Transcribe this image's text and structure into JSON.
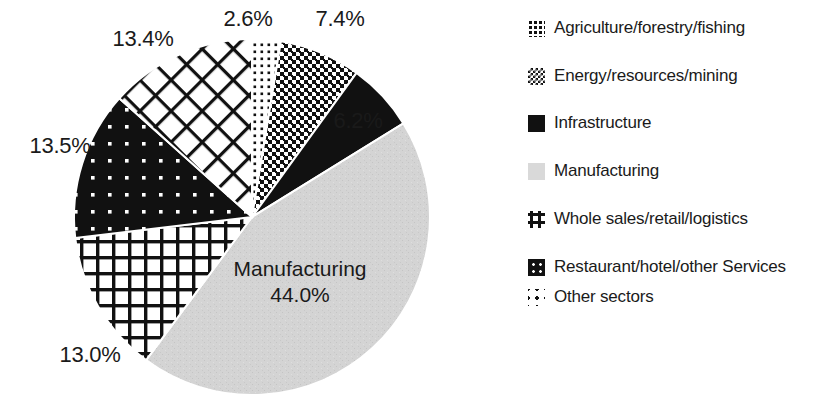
{
  "chart_data": {
    "type": "pie",
    "title": "",
    "start_angle_deg": 0,
    "direction": "clockwise",
    "units": "%",
    "categories": [
      "Agriculture/forestry/fishing",
      "Energy/resources/mining",
      "Infrastructure",
      "Manufacturing",
      "Whole sales/retail/logistics",
      "Restaurant/hotel/other Services",
      "Other sectors"
    ],
    "values": [
      2.6,
      7.4,
      6.2,
      44.0,
      13.0,
      13.5,
      13.4
    ],
    "value_labels": [
      "2.6%",
      "7.4%",
      "6.2%",
      "44.0%",
      "13.0%",
      "13.5%",
      "13.4%"
    ],
    "patterns": [
      "fine-dots",
      "dense-checkerboard",
      "solid-black",
      "light-gray-solid",
      "coarse-grid",
      "black-with-white-dots",
      "diagonal-cross-hatch"
    ],
    "legend_position": "right",
    "grid": false,
    "inside_label": {
      "name": "Manufacturing",
      "value": "44.0%"
    }
  },
  "pie": {
    "center_x": 252,
    "center_y": 217,
    "radius": 178,
    "slices": [
      {
        "name": "Agriculture/forestry/fishing",
        "value": 2.6,
        "label": "2.6%",
        "pattern": "fine-dots",
        "label_x": 248,
        "label_y": 6,
        "anchor": "middle"
      },
      {
        "name": "Energy/resources/mining",
        "value": 7.4,
        "label": "7.4%",
        "pattern": "dense-checkerboard",
        "label_x": 340,
        "label_y": 6,
        "anchor": "middle"
      },
      {
        "name": "Infrastructure",
        "value": 6.2,
        "label": "6.2%",
        "pattern": "solid-black",
        "label_x": 358,
        "label_y": 108,
        "anchor": "middle"
      },
      {
        "name": "Manufacturing",
        "value": 44.0,
        "label": "44.0%",
        "pattern": "light-gray-solid",
        "label_x": 0,
        "label_y": 0,
        "anchor": "inside"
      },
      {
        "name": "Whole sales/retail/logistics",
        "value": 13.0,
        "label": "13.0%",
        "pattern": "coarse-grid",
        "label_x": 90,
        "label_y": 342,
        "anchor": "middle"
      },
      {
        "name": "Restaurant/hotel/other Services",
        "value": 13.5,
        "label": "13.5%",
        "pattern": "black-with-white-dots",
        "label_x": 60,
        "label_y": 133,
        "anchor": "middle"
      },
      {
        "name": "Other sectors",
        "value": 13.4,
        "label": "13.4%",
        "pattern": "diagonal-cross-hatch",
        "label_x": 143,
        "label_y": 26,
        "anchor": "middle"
      }
    ],
    "manufacturing_label": {
      "name": "Manufacturing",
      "value": "44.0%",
      "x": 300,
      "y": 256
    }
  },
  "legend": {
    "items": [
      {
        "label": "Agriculture/forestry/fishing",
        "swatch": "fine-dots",
        "swatch_name": "legend-swatch-agriculture"
      },
      {
        "label": "Energy/resources/mining",
        "swatch": "dense-checkerboard",
        "swatch_name": "legend-swatch-energy"
      },
      {
        "label": "Infrastructure",
        "swatch": "solid-black",
        "swatch_name": "legend-swatch-infrastructure"
      },
      {
        "label": "Manufacturing",
        "swatch": "light-gray-solid",
        "swatch_name": "legend-swatch-manufacturing"
      },
      {
        "label": "Whole sales/retail/logistics",
        "swatch": "coarse-grid",
        "swatch_name": "legend-swatch-wholesales"
      },
      {
        "label": "Restaurant/hotel/other Services",
        "swatch": "black-with-white-dots",
        "swatch_name": "legend-swatch-restaurant"
      },
      {
        "label": "Other sectors",
        "swatch": "diagonal-cross-hatch",
        "swatch_name": "legend-swatch-other"
      }
    ]
  },
  "colors": {
    "background": "#ffffff",
    "ink": "#1a1a1a",
    "manufacturing_gray": "#d4d4d4",
    "black": "#111111"
  }
}
